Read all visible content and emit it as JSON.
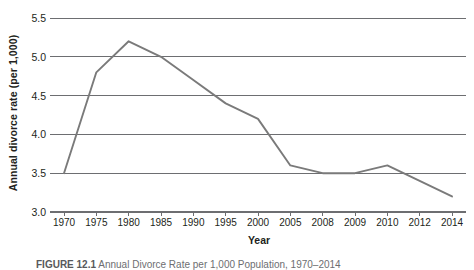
{
  "chart_data": {
    "type": "line",
    "title": "",
    "xlabel": "Year",
    "ylabel": "Annual divorce rate (per 1,000)",
    "categories": [
      "1970",
      "1975",
      "1980",
      "1985",
      "1990",
      "1995",
      "2000",
      "2005",
      "2008",
      "2009",
      "2010",
      "2012",
      "2014"
    ],
    "values": [
      3.5,
      4.8,
      5.2,
      5.0,
      4.7,
      4.4,
      4.2,
      3.6,
      3.5,
      3.5,
      3.6,
      3.4,
      3.2
    ],
    "series": [
      {
        "name": "Annual divorce rate (per 1,000)",
        "values": [
          3.5,
          4.8,
          5.2,
          5.0,
          4.7,
          4.4,
          4.2,
          3.6,
          3.5,
          3.5,
          3.6,
          3.4,
          3.2
        ]
      }
    ],
    "ylim": [
      3.0,
      5.5
    ],
    "yticks": [
      "3.0",
      "3.5",
      "4.0",
      "4.5",
      "5.0",
      "5.5"
    ],
    "ytick_values": [
      3.0,
      3.5,
      4.0,
      4.5,
      5.0,
      5.5
    ],
    "grid": "horizontal",
    "legend": "none",
    "line_color": "#7a7a7a",
    "grid_color": "#6d6e71",
    "axis_color": "#6d6e71",
    "text_color": "#231f20",
    "background": "#ffffff"
  },
  "caption": {
    "label": "FIGURE 12.1",
    "text": "Annual Divorce Rate per 1,000 Population, 1970–2014"
  }
}
